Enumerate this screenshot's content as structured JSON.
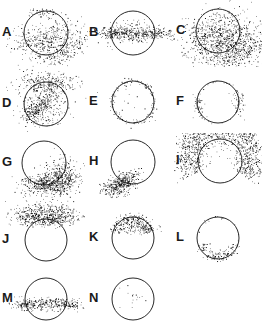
{
  "figure": {
    "title": "",
    "background": "#ffffff",
    "point_color": "#000000",
    "circle_stroke_color": "#111111",
    "columns": 3,
    "rows": 5,
    "panel_count": 14,
    "empty_cells": [
      14
    ]
  },
  "chart_data": {
    "type": "scatter",
    "title": "",
    "xlabel": "",
    "ylabel": "",
    "grid": false,
    "legend": null,
    "panels": [
      {
        "label": "A",
        "row": 0,
        "col": 0,
        "circle": {
          "cx": 46,
          "cy": 33,
          "r": 22
        },
        "n_points": 640,
        "clusters": [
          {
            "cx": 48,
            "cy": 40,
            "sx": 15,
            "sy": 9,
            "weight": 0.45,
            "rot": -28
          },
          {
            "cx": 64,
            "cy": 50,
            "sx": 13,
            "sy": 6,
            "weight": 0.33,
            "rot": -30
          },
          {
            "cx": 30,
            "cy": 38,
            "sx": 11,
            "sy": 6,
            "weight": 0.14,
            "rot": -10
          },
          {
            "cx": 44,
            "cy": 12,
            "sx": 7,
            "sy": 2.2,
            "weight": 0.08,
            "rot": 0
          }
        ]
      },
      {
        "label": "B",
        "row": 0,
        "col": 1,
        "circle": {
          "cx": 46,
          "cy": 33,
          "r": 22
        },
        "n_points": 520,
        "clusters": [
          {
            "cx": 46,
            "cy": 34,
            "sx": 17,
            "sy": 4.2,
            "weight": 0.6,
            "rot": 0
          },
          {
            "cx": 24,
            "cy": 33,
            "sx": 9,
            "sy": 3.0,
            "weight": 0.18,
            "rot": 0
          },
          {
            "cx": 69,
            "cy": 33,
            "sx": 9,
            "sy": 3.0,
            "weight": 0.18,
            "rot": 0
          },
          {
            "cx": 46,
            "cy": 24,
            "sx": 12,
            "sy": 3.5,
            "weight": 0.04,
            "rot": 0
          }
        ]
      },
      {
        "label": "C",
        "row": 0,
        "col": 2,
        "circle": {
          "cx": 44,
          "cy": 31,
          "r": 22
        },
        "n_points": 1150,
        "clusters": [
          {
            "cx": 48,
            "cy": 38,
            "sx": 17,
            "sy": 12,
            "weight": 0.42,
            "rot": -30
          },
          {
            "cx": 62,
            "cy": 47,
            "sx": 15,
            "sy": 9,
            "weight": 0.31,
            "rot": -32
          },
          {
            "cx": 30,
            "cy": 32,
            "sx": 13,
            "sy": 9,
            "weight": 0.17,
            "rot": -20
          },
          {
            "cx": 70,
            "cy": 56,
            "sx": 11,
            "sy": 6,
            "weight": 0.1,
            "rot": -30
          }
        ]
      },
      {
        "label": "D",
        "row": 1,
        "col": 0,
        "circle": {
          "cx": 46,
          "cy": 37,
          "r": 22
        },
        "n_points": 720,
        "clusters": [
          {
            "cx": 46,
            "cy": 15,
            "sx": 15,
            "sy": 5.5,
            "weight": 0.34,
            "rot": 0
          },
          {
            "cx": 42,
            "cy": 33,
            "sx": 14,
            "sy": 7,
            "weight": 0.32,
            "rot": -32
          },
          {
            "cx": 38,
            "cy": 42,
            "sx": 10,
            "sy": 3.4,
            "weight": 0.22,
            "rot": -36
          },
          {
            "cx": 50,
            "cy": 48,
            "sx": 12,
            "sy": 7,
            "weight": 0.12,
            "rot": -20
          }
        ]
      },
      {
        "label": "E",
        "row": 1,
        "col": 1,
        "circle": {
          "cx": 46,
          "cy": 35,
          "r": 21
        },
        "n_points": 150,
        "clusters": [
          {
            "ring": true,
            "cx": 46,
            "cy": 35,
            "r": 21,
            "spread": 1.6,
            "weight": 0.9
          },
          {
            "cx": 46,
            "cy": 35,
            "sx": 13,
            "sy": 12,
            "weight": 0.1,
            "rot": 0
          }
        ]
      },
      {
        "label": "F",
        "row": 1,
        "col": 2,
        "circle": {
          "cx": 44,
          "cy": 35,
          "r": 21
        },
        "n_points": 120,
        "clusters": [
          {
            "cx": 24,
            "cy": 38,
            "sx": 3.5,
            "sy": 6.5,
            "weight": 0.4,
            "rot": 0
          },
          {
            "cx": 64,
            "cy": 36,
            "sx": 3.5,
            "sy": 6.5,
            "weight": 0.4,
            "rot": 0
          },
          {
            "ring": true,
            "cx": 44,
            "cy": 35,
            "r": 21,
            "spread": 1.3,
            "weight": 0.2
          }
        ]
      },
      {
        "label": "G",
        "row": 2,
        "col": 0,
        "circle": {
          "cx": 44,
          "cy": 30,
          "r": 22
        },
        "n_points": 760,
        "clusters": [
          {
            "cx": 57,
            "cy": 45,
            "sx": 11,
            "sy": 8,
            "weight": 0.44,
            "rot": -38
          },
          {
            "cx": 46,
            "cy": 51,
            "sx": 12,
            "sy": 5,
            "weight": 0.28,
            "rot": -12
          },
          {
            "cx": 66,
            "cy": 50,
            "sx": 9,
            "sy": 6,
            "weight": 0.18,
            "rot": -35
          },
          {
            "cx": 34,
            "cy": 50,
            "sx": 8,
            "sy": 3.5,
            "weight": 0.1,
            "rot": 0
          }
        ]
      },
      {
        "label": "H",
        "row": 2,
        "col": 1,
        "circle": {
          "cx": 46,
          "cy": 29,
          "r": 22
        },
        "n_points": 430,
        "clusters": [
          {
            "cx": 34,
            "cy": 50,
            "sx": 8,
            "sy": 5,
            "weight": 0.56,
            "rot": -22
          },
          {
            "cx": 28,
            "cy": 55,
            "sx": 7,
            "sy": 4,
            "weight": 0.26,
            "rot": -18
          },
          {
            "cx": 42,
            "cy": 47,
            "sx": 6,
            "sy": 3.5,
            "weight": 0.18,
            "rot": -30
          }
        ]
      },
      {
        "label": "I",
        "row": 2,
        "col": 2,
        "circle": {
          "cx": 46,
          "cy": 28,
          "r": 22
        },
        "n_points": 1250,
        "clusters": [
          {
            "arc": true,
            "cx": 46,
            "cy": 26,
            "r": 30,
            "a0": 150,
            "a1": 395,
            "spread": 7.5,
            "weight": 0.7
          },
          {
            "arc": true,
            "cx": 46,
            "cy": 26,
            "r": 37,
            "a0": 160,
            "a1": 385,
            "spread": 6.0,
            "weight": 0.3
          }
        ]
      },
      {
        "label": "J",
        "row": 3,
        "col": 0,
        "circle": {
          "cx": 46,
          "cy": 40,
          "r": 21
        },
        "n_points": 620,
        "clusters": [
          {
            "cx": 46,
            "cy": 13,
            "sx": 16,
            "sy": 5.5,
            "weight": 0.48,
            "rot": 0
          },
          {
            "cx": 46,
            "cy": 20,
            "sx": 17,
            "sy": 3.4,
            "weight": 0.34,
            "rot": 0
          },
          {
            "cx": 30,
            "cy": 14,
            "sx": 8,
            "sy": 4,
            "weight": 0.1,
            "rot": 0
          },
          {
            "cx": 64,
            "cy": 15,
            "sx": 8,
            "sy": 4,
            "weight": 0.08,
            "rot": 0
          }
        ]
      },
      {
        "label": "K",
        "row": 3,
        "col": 1,
        "circle": {
          "cx": 46,
          "cy": 38,
          "r": 21
        },
        "n_points": 330,
        "clusters": [
          {
            "arc": true,
            "cx": 46,
            "cy": 38,
            "r": 19,
            "a0": 200,
            "a1": 340,
            "spread": 3.2,
            "weight": 0.72
          },
          {
            "cx": 46,
            "cy": 28,
            "sx": 11,
            "sy": 3.2,
            "weight": 0.28,
            "rot": 0
          }
        ]
      },
      {
        "label": "L",
        "row": 3,
        "col": 2,
        "circle": {
          "cx": 44,
          "cy": 38,
          "r": 21
        },
        "n_points": 150,
        "clusters": [
          {
            "arc": true,
            "cx": 44,
            "cy": 38,
            "r": 18,
            "a0": 20,
            "a1": 160,
            "spread": 2.6,
            "weight": 0.8
          },
          {
            "ring": true,
            "cx": 44,
            "cy": 38,
            "r": 21,
            "spread": 1.1,
            "weight": 0.2
          }
        ]
      },
      {
        "label": "M",
        "row": 4,
        "col": 0,
        "circle": {
          "cx": 46,
          "cy": 33,
          "r": 21
        },
        "n_points": 400,
        "clusters": [
          {
            "cx": 46,
            "cy": 38,
            "sx": 16,
            "sy": 3.2,
            "weight": 0.58,
            "rot": 0
          },
          {
            "cx": 24,
            "cy": 38,
            "sx": 8,
            "sy": 2.2,
            "weight": 0.21,
            "rot": 0
          },
          {
            "cx": 68,
            "cy": 38,
            "sx": 8,
            "sy": 2.2,
            "weight": 0.21,
            "rot": 0
          }
        ]
      },
      {
        "label": "N",
        "row": 4,
        "col": 1,
        "circle": {
          "cx": 46,
          "cy": 33,
          "r": 21
        },
        "n_points": 16,
        "clusters": [
          {
            "cx": 45,
            "cy": 33,
            "sx": 8,
            "sy": 7,
            "weight": 1.0,
            "rot": 0
          }
        ]
      }
    ]
  }
}
